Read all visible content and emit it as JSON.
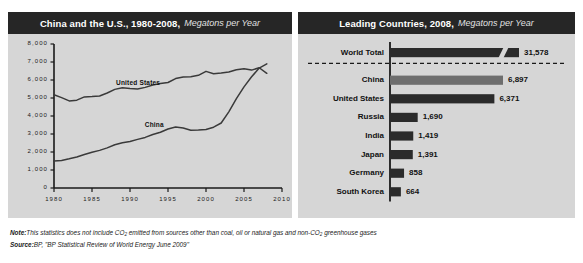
{
  "left_panel": {
    "title": "China and the U.S., 1980-2008,",
    "subtitle": "Megatons per Year"
  },
  "right_panel": {
    "title": "Leading Countries, 2008,",
    "subtitle": "Megatons per Year"
  },
  "footnote": {
    "note_label": "Note:",
    "note_text_a": "This statistics does not include CO",
    "note_sub": "2",
    "note_text_b": " emitted from sources other than coal, oil or natural gas and non-CO",
    "note_sub_b": "2",
    "note_text_c": " greenhouse gases",
    "source_label": "Source:",
    "source_text": "BP, \"BP Statistical Review of World Energy June 2009\""
  },
  "colors": {
    "panel_bg": "#d6d6d6",
    "header_bg": "#262626",
    "bar_dark": "#2b2b2b",
    "bar_light": "#6e6e6e",
    "axis": "#1a1a1a",
    "line": "#3a3a3a"
  },
  "chart_data": [
    {
      "type": "line",
      "title": "China and the U.S., 1980-2008",
      "xlabel": "",
      "ylabel": "Megatons per Year",
      "xlim": [
        1980,
        2010
      ],
      "ylim": [
        0,
        8000
      ],
      "xticks": [
        "1980",
        "1985",
        "1990",
        "1995",
        "2000",
        "2005",
        "2010"
      ],
      "yticks": [
        "0",
        "1,000",
        "2,000",
        "3,000",
        "4,000",
        "5,000",
        "6,000",
        "7,000",
        "8,000"
      ],
      "grid": false,
      "legend": "inline-labels",
      "x": [
        1980,
        1981,
        1982,
        1983,
        1984,
        1985,
        1986,
        1987,
        1988,
        1989,
        1990,
        1991,
        1992,
        1993,
        1994,
        1995,
        1996,
        1997,
        1998,
        1999,
        2000,
        2001,
        2002,
        2003,
        2004,
        2005,
        2006,
        2007,
        2008
      ],
      "series": [
        {
          "name": "United States",
          "values": [
            5180,
            5020,
            4840,
            4880,
            5060,
            5080,
            5110,
            5280,
            5480,
            5570,
            5530,
            5500,
            5590,
            5720,
            5800,
            5860,
            6080,
            6170,
            6180,
            6260,
            6480,
            6350,
            6390,
            6440,
            6570,
            6620,
            6550,
            6680,
            6371
          ]
        },
        {
          "name": "China",
          "values": [
            1500,
            1530,
            1620,
            1720,
            1860,
            1990,
            2090,
            2230,
            2400,
            2510,
            2580,
            2700,
            2810,
            2970,
            3100,
            3280,
            3390,
            3330,
            3210,
            3220,
            3250,
            3380,
            3610,
            4230,
            4960,
            5620,
            6180,
            6660,
            6897
          ]
        }
      ]
    },
    {
      "type": "bar",
      "orientation": "horizontal",
      "title": "Leading Countries, 2008",
      "xlabel": "Megatons per Year",
      "ylabel": "",
      "axis_break": true,
      "separator_after": "World Total",
      "categories": [
        "World Total",
        "China",
        "United States",
        "Russia",
        "India",
        "Japan",
        "Germany",
        "South Korea"
      ],
      "values": [
        31578,
        6897,
        6371,
        1690,
        1419,
        1391,
        858,
        664
      ],
      "value_labels": [
        "31,578",
        "6,897",
        "6,371",
        "1,690",
        "1,419",
        "1,391",
        "858",
        "664"
      ],
      "highlight": "China"
    }
  ]
}
